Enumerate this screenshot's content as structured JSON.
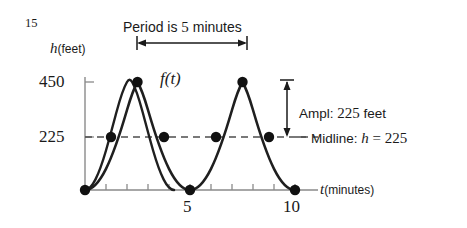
{
  "figure": {
    "number": "15",
    "caption_above": "Period is 5 minutes",
    "function_label": "f(t)",
    "y_axis_label_variable": "h",
    "y_axis_label_units": "(feet)",
    "x_axis_label_variable": "t",
    "x_axis_label_units": "(minutes)",
    "amplitude_annotation": "Ampl: 225 feet",
    "amplitude_annotation_prefix": "Ampl: ",
    "amplitude_annotation_value": "225",
    "amplitude_annotation_suffix": " feet",
    "midline_annotation_prefix": "Midline: ",
    "midline_annotation_equation": "h = 225",
    "period_text_prefix": "Period is ",
    "period_text_value": "5",
    "period_text_suffix": " minutes"
  },
  "colors": {
    "curve": "#1a1a1a",
    "axis": "#808080",
    "midline": "#4d4d4d",
    "point": "#111111",
    "annotation": "#1a1a1a",
    "background": "#ffffff"
  },
  "chart_data": {
    "type": "line",
    "title": "",
    "xlabel": "t (minutes)",
    "ylabel": "h (feet)",
    "xlim": [
      0,
      10
    ],
    "ylim": [
      0,
      450
    ],
    "grid": false,
    "legend": "none",
    "x_ticks": [
      0,
      1,
      2,
      3,
      4,
      5,
      6,
      7,
      8,
      9,
      10
    ],
    "x_tick_labels": [
      "",
      "",
      "",
      "",
      "",
      "5",
      "",
      "",
      "",
      "",
      "10"
    ],
    "y_ticks": [
      225,
      450
    ],
    "y_tick_labels": [
      "225",
      "450"
    ],
    "function": "h = 225 - 225*cos(2*pi*t/5)",
    "amplitude": 225,
    "midline": 225,
    "period": 5,
    "minimum": 0,
    "maximum": 450,
    "series": [
      {
        "name": "f(t)",
        "x": [
          0,
          1.25,
          2.5,
          3.75,
          5,
          6.25,
          7.5,
          8.75,
          10
        ],
        "values": [
          0,
          225,
          450,
          225,
          0,
          225,
          450,
          225,
          0
        ]
      }
    ],
    "marked_points": [
      {
        "t": 0,
        "h": 0,
        "kind": "minimum"
      },
      {
        "t": 1.25,
        "h": 225,
        "kind": "midline-crossing"
      },
      {
        "t": 2.5,
        "h": 450,
        "kind": "maximum"
      },
      {
        "t": 3.75,
        "h": 225,
        "kind": "midline-crossing"
      },
      {
        "t": 5,
        "h": 0,
        "kind": "minimum"
      },
      {
        "t": 6.25,
        "h": 225,
        "kind": "midline-crossing"
      },
      {
        "t": 7.5,
        "h": 450,
        "kind": "maximum"
      },
      {
        "t": 8.75,
        "h": 225,
        "kind": "midline-crossing"
      },
      {
        "t": 10,
        "h": 0,
        "kind": "minimum"
      }
    ],
    "annotations": [
      {
        "text": "Period is 5 minutes",
        "type": "horizontal-span-arrow",
        "from_t": 2.5,
        "to_t": 7.5
      },
      {
        "text": "Ampl: 225 feet",
        "type": "vertical-span-arrow",
        "from_h": 225,
        "to_h": 450
      },
      {
        "text": "Midline: h = 225",
        "type": "dashed-line",
        "at_h": 225
      }
    ]
  }
}
